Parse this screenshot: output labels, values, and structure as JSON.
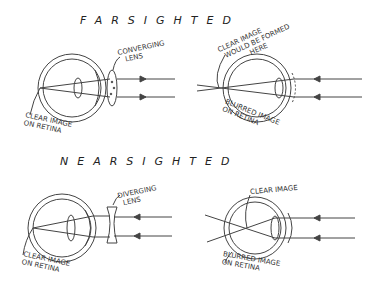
{
  "sections": {
    "farsighted": {
      "title": "FARSIGHTED",
      "corrected": {
        "lens_label": [
          "CONVERGING",
          "LENS"
        ],
        "retina_label": [
          "CLEAR IMAGE",
          "ON RETINA"
        ]
      },
      "uncorrected": {
        "focus_label": [
          "CLEAR IMAGE",
          "WOULD BE FORMED",
          "HERE"
        ],
        "retina_label": [
          "BLURRED IMAGE",
          "ON RETINA"
        ]
      }
    },
    "nearsighted": {
      "title": "NEARSIGHTED",
      "corrected": {
        "lens_label": [
          "DIVERGING",
          "LENS"
        ],
        "retina_label": [
          "CLEAR IMAGE",
          "ON RETINA"
        ]
      },
      "uncorrected": {
        "focus_label": [
          "CLEAR IMAGE"
        ],
        "retina_label": [
          "BLURRED IMAGE",
          "ON RETINA"
        ]
      }
    }
  },
  "colors": {
    "ink": "#333333",
    "background": "#ffffff"
  }
}
